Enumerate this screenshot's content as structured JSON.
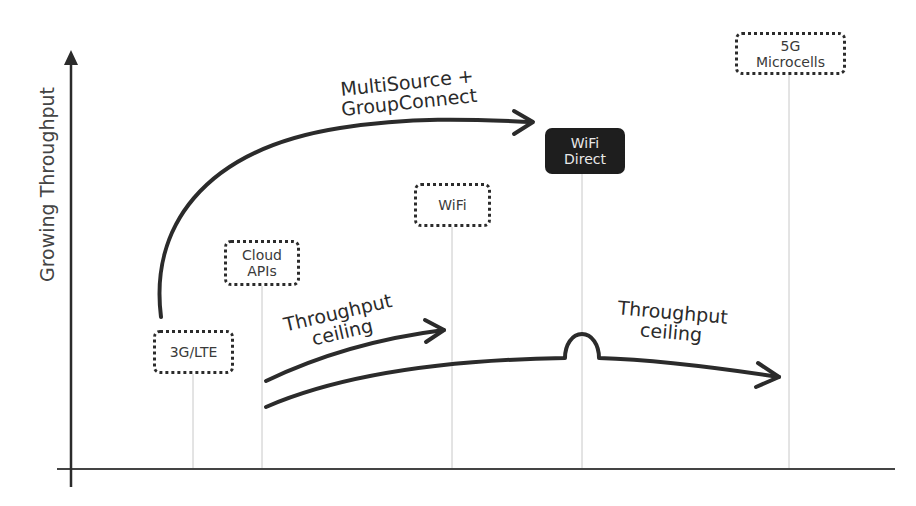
{
  "diagram": {
    "y_axis_label": "Growing Throughput",
    "nodes": [
      {
        "id": "3g-lte",
        "label": "3G/LTE",
        "style": "dotted"
      },
      {
        "id": "cloud-apis",
        "label": "Cloud\nAPIs",
        "style": "dotted"
      },
      {
        "id": "wifi",
        "label": "WiFi",
        "style": "dotted"
      },
      {
        "id": "wifi-direct",
        "label": "WiFi\nDirect",
        "style": "filled"
      },
      {
        "id": "5g-microcells",
        "label": "5G\nMicrocells",
        "style": "dotted"
      }
    ],
    "annotations": {
      "multisource": "MultiSource +\nGroupConnect",
      "ceiling_left": "Throughput\nceiling",
      "ceiling_right": "Throughput\nceiling"
    },
    "colors": {
      "stroke": "#2b2b2b",
      "guide_line": "#c8c8c8",
      "filled_node": "#1e1e1e",
      "filled_node_text": "#e8e8e8"
    }
  }
}
